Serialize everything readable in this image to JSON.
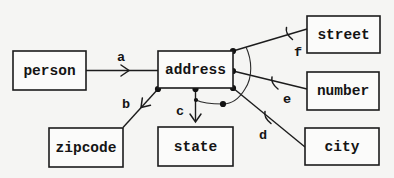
{
  "diagram": {
    "type": "entity-link-diagram",
    "colors": {
      "background": "#f5f5f3",
      "line": "#1c1c1c",
      "box_fill": "#fbfbfa",
      "text": "#141414"
    },
    "nodes": {
      "person": {
        "label": "person"
      },
      "address": {
        "label": "address"
      },
      "street": {
        "label": "street"
      },
      "number": {
        "label": "number"
      },
      "city": {
        "label": "city"
      },
      "state": {
        "label": "state"
      },
      "zipcode": {
        "label": "zipcode"
      }
    },
    "edges": {
      "a": {
        "label": "a",
        "from": "person",
        "to": "address",
        "marker": "arrowhead"
      },
      "b": {
        "label": "b",
        "from": "address",
        "to": "zipcode",
        "marker": "arrowhead"
      },
      "c": {
        "label": "c",
        "from": "address",
        "to": "state",
        "marker": "arrowhead"
      },
      "d": {
        "label": "d",
        "from": "address",
        "to": "city",
        "marker": "tick"
      },
      "e": {
        "label": "e",
        "from": "address",
        "to": "number",
        "marker": "tick"
      },
      "f": {
        "label": "f",
        "from": "address",
        "to": "street",
        "marker": "tick"
      }
    }
  }
}
